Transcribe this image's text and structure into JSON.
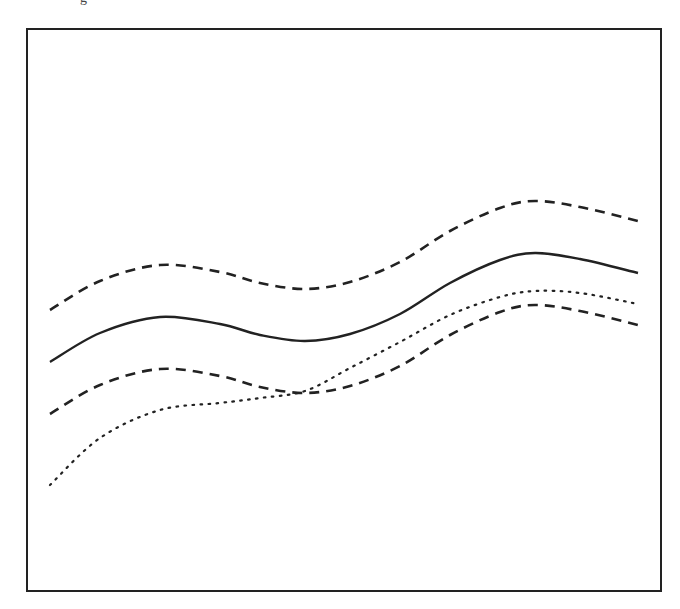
{
  "top_fragment": "g",
  "chart_data": {
    "type": "line",
    "title": "",
    "xlabel": "",
    "ylabel": "",
    "grid": false,
    "legend": null,
    "frame": {
      "x0": 27,
      "y0": 29,
      "x1": 661,
      "y1": 591,
      "stroke": "#222222"
    },
    "x": [
      50,
      100,
      160,
      220,
      260,
      305,
      350,
      400,
      450,
      500,
      535,
      580,
      638
    ],
    "series": [
      {
        "name": "upper-band",
        "style": "dashed",
        "color": "#222222",
        "values": [
          310,
          281,
          265,
          272,
          283,
          289,
          282,
          262,
          231,
          208,
          201,
          207,
          221
        ]
      },
      {
        "name": "mean",
        "style": "solid",
        "color": "#222222",
        "values": [
          362,
          333,
          317,
          324,
          335,
          341,
          334,
          314,
          283,
          260,
          253,
          259,
          273
        ]
      },
      {
        "name": "lower-band",
        "style": "dashed",
        "color": "#222222",
        "values": [
          414,
          385,
          369,
          376,
          387,
          393,
          386,
          366,
          335,
          312,
          305,
          311,
          325
        ]
      },
      {
        "name": "observed",
        "style": "dotted",
        "color": "#222222",
        "values": [
          485,
          438,
          410,
          403,
          398,
          391,
          368,
          342,
          315,
          297,
          291,
          293,
          304
        ]
      }
    ]
  }
}
